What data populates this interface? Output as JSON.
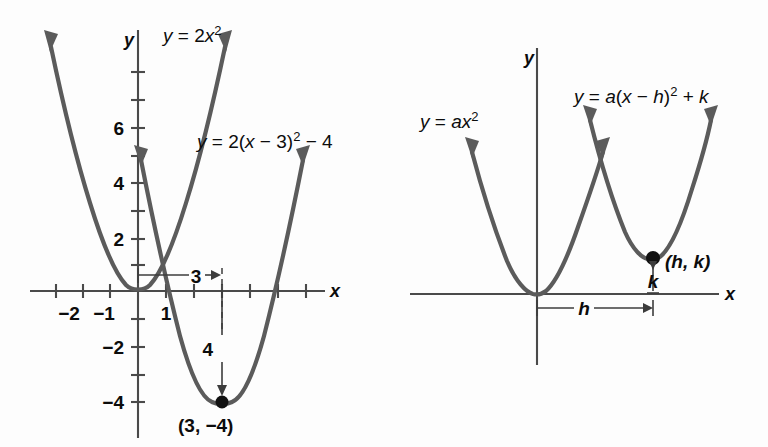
{
  "figure": {
    "stroke_color": "#5b5b5b",
    "axis_color": "#4a4a4a",
    "background": "#fdfdfd"
  },
  "left_panel": {
    "name": "concrete-example",
    "axis_x_label": "x",
    "axis_y_label": "y",
    "x_ticks": [
      -3,
      -2,
      -1,
      1,
      2,
      3,
      4,
      5,
      6,
      7
    ],
    "x_tick_labels": [
      {
        "value": -2,
        "text": "−2"
      },
      {
        "value": -1,
        "text": "−1"
      },
      {
        "value": 1,
        "text": "1"
      }
    ],
    "y_tick_labels": [
      {
        "value": 6,
        "text": "6"
      },
      {
        "value": 4,
        "text": "4"
      },
      {
        "value": 2,
        "text": "2"
      },
      {
        "value": -2,
        "text": "−2"
      },
      {
        "value": -4,
        "text": "−4"
      }
    ],
    "curves": [
      {
        "name": "parent-parabola",
        "label_prefix": "y = 2",
        "label_var": "x",
        "label_sup": "2",
        "equation": "y = 2x²",
        "a": 2,
        "h": 0,
        "k": 0
      },
      {
        "name": "shifted-parabola",
        "equation": "y = 2(x − 3)² − 4",
        "a": 2,
        "h": 3,
        "k": -4
      }
    ],
    "equation_parent": {
      "t1": "y",
      "t2": " = 2",
      "t3": "x",
      "sup": "2"
    },
    "equation_shifted": {
      "t1": "y",
      "t2": " = 2(",
      "t3": "x",
      "t4": " − 3)",
      "sup": "2",
      "t5": " − 4"
    },
    "annotation_horizontal": {
      "label": "3",
      "from_x": 0,
      "to_x": 3,
      "at_y": 0.5
    },
    "annotation_vertical": {
      "label": "4",
      "at_x": 3,
      "from_y": 0,
      "to_y": -4
    },
    "vertex": {
      "label": "(3,  −4)",
      "x": 3,
      "y": -4
    }
  },
  "right_panel": {
    "name": "general-form",
    "axis_x_label": "x",
    "axis_y_label": "y",
    "curves": [
      {
        "name": "parent-parabola-general",
        "equation": "y = ax²"
      },
      {
        "name": "shifted-parabola-general",
        "equation": "y = a(x − h)² + k"
      }
    ],
    "equation_parent": {
      "t1": "y",
      "t2": " = ",
      "t3": "ax",
      "sup": "2"
    },
    "equation_shifted": {
      "t1": "y",
      "t2": " = ",
      "t3": "a",
      "t4": "(",
      "t5": "x",
      "t6": " − ",
      "t7": "h",
      "t8": ")",
      "sup": "2",
      "t9": " + ",
      "t10": "k"
    },
    "vertex_label": "(h, k)",
    "annotation_h": "h",
    "annotation_k": "k"
  }
}
